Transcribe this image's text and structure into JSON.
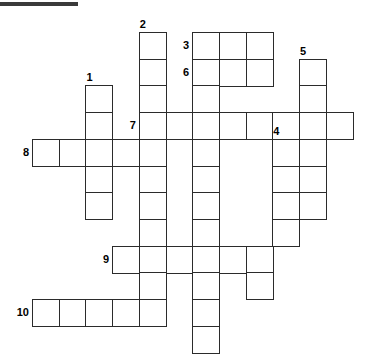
{
  "puzzle": {
    "title_rule": {
      "present": true,
      "x": 0,
      "y": 2,
      "width": 78,
      "height": 4,
      "color": "#3a3a3a"
    },
    "grid": {
      "cell_size": 26.7,
      "origin_x": 32,
      "origin_y": 32,
      "line_color": "#2b2b2b",
      "cell_fill": "#ffffff",
      "columns": 13,
      "rows": 12
    },
    "numbers": [
      {
        "label": "1",
        "col": 2,
        "row": 2
      },
      {
        "label": "2",
        "col": 4,
        "row": 0
      },
      {
        "label": "3",
        "col": 6,
        "row": 0
      },
      {
        "label": "4",
        "col": 9,
        "row": 4
      },
      {
        "label": "5",
        "col": 10,
        "row": 1
      },
      {
        "label": "6",
        "col": 6,
        "row": 1
      },
      {
        "label": "7",
        "col": 4,
        "row": 3
      },
      {
        "label": "8",
        "col": 0,
        "row": 4
      },
      {
        "label": "9",
        "col": 3,
        "row": 8
      },
      {
        "label": "10",
        "col": 0,
        "row": 10
      }
    ],
    "entries": [
      {
        "number": "1",
        "direction": "down",
        "col": 2,
        "row": 2,
        "length": 4
      },
      {
        "number": "2",
        "direction": "down",
        "col": 4,
        "row": 0,
        "length": 10
      },
      {
        "number": "3",
        "direction": "down",
        "col": 6,
        "row": 0,
        "length": 11
      },
      {
        "number": "3",
        "direction": "across",
        "col": 6,
        "row": 0,
        "length": 3
      },
      {
        "number": "4",
        "direction": "down",
        "col": 9,
        "row": 4,
        "length": 5
      },
      {
        "number": "5",
        "direction": "down",
        "col": 10,
        "row": 1,
        "length": 6
      },
      {
        "number": "6",
        "direction": "across",
        "col": 6,
        "row": 1,
        "length": 3
      },
      {
        "number": "7",
        "direction": "across",
        "col": 4,
        "row": 3,
        "length": 8
      },
      {
        "number": "8",
        "direction": "across",
        "col": 0,
        "row": 4,
        "length": 5
      },
      {
        "number": "9",
        "direction": "across",
        "col": 3,
        "row": 8,
        "length": 6
      },
      {
        "number": "10",
        "direction": "across",
        "col": 0,
        "row": 10,
        "length": 5
      }
    ],
    "cells": [
      {
        "col": 4,
        "row": 0
      },
      {
        "col": 6,
        "row": 0
      },
      {
        "col": 7,
        "row": 0
      },
      {
        "col": 8,
        "row": 0
      },
      {
        "col": 4,
        "row": 1
      },
      {
        "col": 6,
        "row": 1
      },
      {
        "col": 7,
        "row": 1
      },
      {
        "col": 8,
        "row": 1
      },
      {
        "col": 10,
        "row": 1
      },
      {
        "col": 2,
        "row": 2
      },
      {
        "col": 4,
        "row": 2
      },
      {
        "col": 6,
        "row": 2
      },
      {
        "col": 10,
        "row": 2
      },
      {
        "col": 2,
        "row": 3
      },
      {
        "col": 4,
        "row": 3
      },
      {
        "col": 5,
        "row": 3
      },
      {
        "col": 6,
        "row": 3
      },
      {
        "col": 7,
        "row": 3
      },
      {
        "col": 8,
        "row": 3
      },
      {
        "col": 9,
        "row": 3
      },
      {
        "col": 10,
        "row": 3
      },
      {
        "col": 11,
        "row": 3
      },
      {
        "col": 0,
        "row": 4
      },
      {
        "col": 1,
        "row": 4
      },
      {
        "col": 2,
        "row": 4
      },
      {
        "col": 3,
        "row": 4
      },
      {
        "col": 4,
        "row": 4
      },
      {
        "col": 6,
        "row": 4
      },
      {
        "col": 9,
        "row": 4
      },
      {
        "col": 10,
        "row": 4
      },
      {
        "col": 2,
        "row": 5
      },
      {
        "col": 4,
        "row": 5
      },
      {
        "col": 6,
        "row": 5
      },
      {
        "col": 9,
        "row": 5
      },
      {
        "col": 10,
        "row": 5
      },
      {
        "col": 2,
        "row": 6
      },
      {
        "col": 4,
        "row": 6
      },
      {
        "col": 6,
        "row": 6
      },
      {
        "col": 9,
        "row": 6
      },
      {
        "col": 10,
        "row": 6
      },
      {
        "col": 4,
        "row": 7
      },
      {
        "col": 6,
        "row": 7
      },
      {
        "col": 9,
        "row": 7
      },
      {
        "col": 3,
        "row": 8
      },
      {
        "col": 4,
        "row": 8
      },
      {
        "col": 5,
        "row": 8
      },
      {
        "col": 6,
        "row": 8
      },
      {
        "col": 7,
        "row": 8
      },
      {
        "col": 8,
        "row": 8
      },
      {
        "col": 4,
        "row": 9
      },
      {
        "col": 6,
        "row": 9
      },
      {
        "col": 8,
        "row": 9
      },
      {
        "col": 0,
        "row": 10
      },
      {
        "col": 1,
        "row": 10
      },
      {
        "col": 2,
        "row": 10
      },
      {
        "col": 3,
        "row": 10
      },
      {
        "col": 4,
        "row": 10
      },
      {
        "col": 6,
        "row": 10
      },
      {
        "col": 6,
        "row": 11
      }
    ]
  }
}
